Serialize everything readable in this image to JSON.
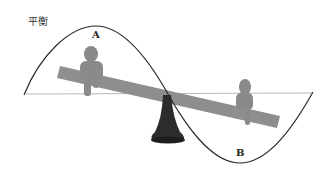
{
  "title": "平衡",
  "labels": {
    "point_a": "A",
    "point_b": "B"
  },
  "colors": {
    "wave": "#2a2a2a",
    "baseline": "#b8b8b8",
    "plank": "#8e8e8e",
    "figure": "#8a8a8a",
    "fulcrum": "#2c2c2c",
    "background": "#ffffff"
  },
  "figures": [
    {
      "name": "person-a",
      "position": "left end of seesaw, raised"
    },
    {
      "name": "person-b",
      "position": "right end of seesaw, lowered"
    }
  ]
}
